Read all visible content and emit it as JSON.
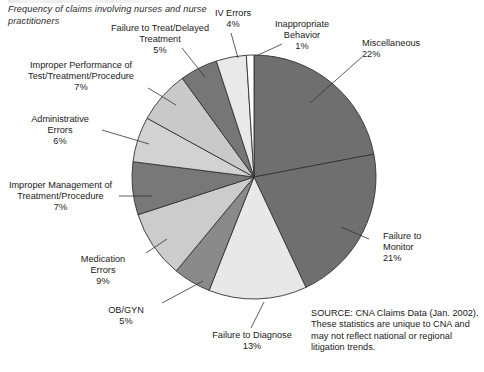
{
  "title": "Frequency of claims involving nurses\nand nurse practitioners",
  "source_note": "SOURCE: CNA Claims Data (Jan. 2002).\nThese statistics are unique to CNA and\nmay not reflect national or regional\nlitigation trends.",
  "labels": {
    "miscellaneous": "Miscellaneous\n22%",
    "failure_to_monitor": "Failure to\nMonitor\n21%",
    "failure_to_diagnose": "Failure to Diagnose\n13%",
    "ob_gyn": "OB/GYN\n5%",
    "medication_errors": "Medication\nErrors\n9%",
    "improper_management": "Improper Management of\nTreatment/Procedure\n7%",
    "administrative_errors": "Administrative\nErrors\n6%",
    "improper_performance": "Improper Performance of\nTest/Treatment/Procedure\n7%",
    "failure_to_treat": "Failure to Treat/Delayed\nTreatment\n5%",
    "iv_errors": "IV Errors\n4%",
    "inappropriate_behavior": "Inappropriate\nBehavior\n1%"
  },
  "chart_data": {
    "type": "pie",
    "title": "Frequency of claims involving nurses and nurse practitioners",
    "units": "percent",
    "start_angle_deg": 0,
    "direction": "clockwise",
    "center": [
      254,
      177
    ],
    "radius": 122,
    "total": 100,
    "slices": [
      {
        "name": "Miscellaneous",
        "value": 22,
        "label": "22%",
        "color": "#6f6f6f"
      },
      {
        "name": "Failure to Monitor",
        "value": 21,
        "label": "21%",
        "color": "#6f6f6f"
      },
      {
        "name": "Failure to Diagnose",
        "value": 13,
        "label": "13%",
        "color": "#e8e8e8"
      },
      {
        "name": "OB/GYN",
        "value": 5,
        "label": "5%",
        "color": "#8a8a8a"
      },
      {
        "name": "Medication Errors",
        "value": 9,
        "label": "9%",
        "color": "#cccccc"
      },
      {
        "name": "Improper Management of Treatment/Procedure",
        "value": 7,
        "label": "7%",
        "color": "#787878"
      },
      {
        "name": "Administrative Errors",
        "value": 6,
        "label": "6%",
        "color": "#d2d2d2"
      },
      {
        "name": "Improper Performance of Test/Treatment/Procedure",
        "value": 7,
        "label": "7%",
        "color": "#c9c9c9"
      },
      {
        "name": "Failure to Treat/Delayed Treatment",
        "value": 5,
        "label": "5%",
        "color": "#767676"
      },
      {
        "name": "IV Errors",
        "value": 4,
        "label": "4%",
        "color": "#e9e9e9"
      },
      {
        "name": "Inappropriate Behavior",
        "value": 1,
        "label": "1%",
        "color": "#fdfdfd"
      }
    ],
    "slice_stroke": "#333333",
    "legend": "callout-labels-with-leader-lines",
    "grid": false
  },
  "leader_lines": [
    {
      "name": "miscellaneous",
      "x1": 362,
      "y1": 57,
      "x2": 310,
      "y2": 103
    },
    {
      "name": "failure-to-monitor",
      "x1": 369,
      "y1": 239,
      "x2": 341,
      "y2": 227
    },
    {
      "name": "failure-to-diagnose",
      "x1": 251,
      "y1": 328,
      "x2": 264,
      "y2": 302
    },
    {
      "name": "ob-gyn",
      "x1": 162,
      "y1": 303,
      "x2": 203,
      "y2": 281
    },
    {
      "name": "medication-errors",
      "x1": 146,
      "y1": 253,
      "x2": 167,
      "y2": 239
    },
    {
      "name": "improper-management",
      "x1": 119,
      "y1": 196,
      "x2": 152,
      "y2": 196
    },
    {
      "name": "administrative-errors",
      "x1": 102,
      "y1": 130,
      "x2": 149,
      "y2": 144
    },
    {
      "name": "improper-performance",
      "x1": 148,
      "y1": 88,
      "x2": 176,
      "y2": 105
    },
    {
      "name": "failure-to-treat",
      "x1": 182,
      "y1": 48,
      "x2": 205,
      "y2": 77
    },
    {
      "name": "iv-errors",
      "x1": 231,
      "y1": 33,
      "x2": 238,
      "y2": 58
    },
    {
      "name": "inappropriate-behavior",
      "x1": 282,
      "y1": 44,
      "x2": 256,
      "y2": 56
    }
  ]
}
